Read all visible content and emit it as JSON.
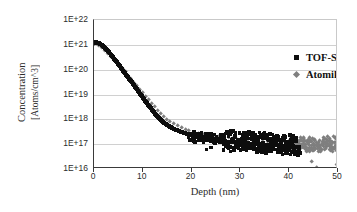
{
  "chart_data": {
    "type": "scatter",
    "title": "",
    "xlabel": "Depth (nm)",
    "ylabel_line1": "Concentration",
    "ylabel_line2": "[Atoms/cm^3]",
    "xlim": [
      0,
      50
    ],
    "ylim": [
      1e+16,
      1e+22
    ],
    "yscale": "log",
    "xticks": [
      0,
      10,
      20,
      30,
      40,
      50
    ],
    "xtick_labels": [
      "0",
      "10",
      "20",
      "30",
      "40",
      "50"
    ],
    "ytick_labels": [
      "1E+22",
      "1E+21",
      "1E+20",
      "1E+19",
      "1E+18",
      "1E+17",
      "1E+16"
    ],
    "ytick_values": [
      1e+22,
      1e+21,
      1e+20,
      1e+19,
      1e+18,
      1e+17,
      1e+16
    ],
    "grid": "horizontal",
    "legend_position": "inside-top-center",
    "colors": {
      "tof_sims": "#0d0d0d",
      "atomika": "#7f7f7f",
      "axis": "#3a3a3a",
      "grid": "#d0d0d0"
    },
    "series": [
      {
        "name": "TOF-SIMS IV",
        "marker": "square",
        "color": "#0d0d0d",
        "points": [
          [
            0.0,
            1.15e+21
          ],
          [
            0.3,
            1.3e+21
          ],
          [
            0.6,
            1.25e+21
          ],
          [
            0.9,
            1.2e+21
          ],
          [
            1.2,
            1.1e+21
          ],
          [
            1.5,
            1e+21
          ],
          [
            1.8,
            9e+20
          ],
          [
            2.1,
            8e+20
          ],
          [
            2.4,
            7e+20
          ],
          [
            2.7,
            6e+20
          ],
          [
            3.0,
            5.2e+20
          ],
          [
            3.3,
            4.4e+20
          ],
          [
            3.6,
            3.7e+20
          ],
          [
            3.9,
            3.1e+20
          ],
          [
            4.2,
            2.6e+20
          ],
          [
            4.5,
            2.2e+20
          ],
          [
            4.8,
            1.85e+20
          ],
          [
            5.1,
            1.55e+20
          ],
          [
            5.4,
            1.3e+20
          ],
          [
            5.7,
            1.08e+20
          ],
          [
            6.0,
            9e+19
          ],
          [
            6.3,
            7.5e+19
          ],
          [
            6.6,
            6.2e+19
          ],
          [
            6.9,
            5.2e+19
          ],
          [
            7.2,
            4.3e+19
          ],
          [
            7.5,
            3.6e+19
          ],
          [
            7.8,
            3e+19
          ],
          [
            8.1,
            2.5e+19
          ],
          [
            8.4,
            2.05e+19
          ],
          [
            8.7,
            1.7e+19
          ],
          [
            9.0,
            1.42e+19
          ],
          [
            9.3,
            1.18e+19
          ],
          [
            9.6,
            9.8e+18
          ],
          [
            9.9,
            8.1e+18
          ],
          [
            10.2,
            6.7e+18
          ],
          [
            10.5,
            5.6e+18
          ],
          [
            10.8,
            4.6e+18
          ],
          [
            11.1,
            3.85e+18
          ],
          [
            11.4,
            3.2e+18
          ],
          [
            11.7,
            2.7e+18
          ],
          [
            12.0,
            2.25e+18
          ],
          [
            12.3,
            1.9e+18
          ],
          [
            12.6,
            1.62e+18
          ],
          [
            12.9,
            1.4e+18
          ],
          [
            13.2,
            1.2e+18
          ],
          [
            13.5,
            1.05e+18
          ],
          [
            13.8,
            9.2e+17
          ],
          [
            14.1,
            8.1e+17
          ],
          [
            14.4,
            7.2e+17
          ],
          [
            14.7,
            6.4e+17
          ],
          [
            15.0,
            5.8e+17
          ],
          [
            15.4,
            5.2e+17
          ],
          [
            15.8,
            4.7e+17
          ],
          [
            16.2,
            4.3e+17
          ],
          [
            16.6,
            3.95e+17
          ],
          [
            17.0,
            3.65e+17
          ],
          [
            17.4,
            3.4e+17
          ],
          [
            17.8,
            3.15e+17
          ],
          [
            18.2,
            2.95e+17
          ],
          [
            18.6,
            2.75e+17
          ],
          [
            19.0,
            2.6e+17
          ],
          [
            19.4,
            2.45e+17
          ],
          [
            19.8,
            2.3e+17
          ],
          [
            20.2,
            2.2e+17
          ],
          [
            20.6,
            2.1e+17
          ],
          [
            21.0,
            2e+17
          ],
          [
            21.5,
            1.9e+17
          ],
          [
            22.0,
            1.82e+17
          ],
          [
            22.5,
            1.75e+17
          ],
          [
            23.0,
            1.68e+17
          ],
          [
            23.5,
            1.6e+17
          ],
          [
            24.0,
            1.55e+17
          ],
          [
            24.5,
            1.5e+17
          ],
          [
            25.0,
            1.45e+17
          ],
          [
            25.5,
            1.4e+17
          ],
          [
            26.0,
            1.36e+17
          ],
          [
            26.5,
            1.32e+17
          ],
          [
            27.0,
            1.3e+17
          ],
          [
            27.5,
            1.26e+17
          ],
          [
            28.0,
            1.24e+17
          ],
          [
            28.5,
            1.2e+17
          ],
          [
            29.0,
            1.18e+17
          ],
          [
            29.5,
            1.15e+17
          ],
          [
            30.0,
            1.13e+17
          ],
          [
            30.5,
            1.1e+17
          ],
          [
            31.0,
            1.09e+17
          ],
          [
            31.5,
            1.07e+17
          ],
          [
            32.0,
            1.05e+17
          ],
          [
            32.5,
            1.04e+17
          ],
          [
            33.0,
            1.02e+17
          ],
          [
            33.5,
            1e+17
          ],
          [
            34.0,
            9.9e+16
          ],
          [
            34.5,
            9.8e+16
          ],
          [
            35.0,
            9.6e+16
          ],
          [
            35.5,
            9.5e+16
          ],
          [
            36.0,
            9.4e+16
          ],
          [
            36.5,
            9.2e+16
          ],
          [
            37.0,
            9.1e+16
          ],
          [
            37.5,
            9e+16
          ],
          [
            38.0,
            8.9e+16
          ],
          [
            38.5,
            8.8e+16
          ],
          [
            39.0,
            8.7e+16
          ],
          [
            39.5,
            8.6e+16
          ],
          [
            40.0,
            8.5e+16
          ],
          [
            40.5,
            8.3e+16
          ],
          [
            41.0,
            8.2e+16
          ],
          [
            41.5,
            8e+16
          ],
          [
            42.0,
            7.9e+16
          ]
        ],
        "scatter_low": [
          [
            23.0,
            6.2e+16
          ],
          [
            24.0,
            7.5e+16
          ],
          [
            26.5,
            5.8e+16
          ],
          [
            28.0,
            5e+16
          ],
          [
            28.8,
            6.6e+16
          ],
          [
            29.6,
            7e+16
          ],
          [
            30.4,
            6.4e+16
          ],
          [
            31.2,
            5.6e+16
          ],
          [
            32.0,
            6.9e+16
          ],
          [
            32.8,
            6.1e+16
          ],
          [
            33.6,
            5.4e+16
          ],
          [
            34.4,
            6.8e+16
          ],
          [
            35.2,
            6e+16
          ],
          [
            36.0,
            5.2e+16
          ],
          [
            36.8,
            6.5e+16
          ],
          [
            37.6,
            5.9e+16
          ],
          [
            38.4,
            4.7e+16
          ],
          [
            39.2,
            6.3e+16
          ],
          [
            40.0,
            5.5e+16
          ],
          [
            40.8,
            4.9e+16
          ],
          [
            41.6,
            5.1e+16
          ],
          [
            42.2,
            4.4e+16
          ]
        ],
        "scatter_high": [
          [
            20.5,
            3.1e+17
          ],
          [
            22.0,
            2.9e+17
          ],
          [
            24.0,
            2.6e+17
          ],
          [
            26.0,
            2.4e+17
          ],
          [
            27.5,
            2.2e+17
          ],
          [
            29.0,
            2.1e+17
          ],
          [
            30.5,
            2.05e+17
          ],
          [
            31.5,
            1.95e+17
          ],
          [
            33.0,
            1.8e+17
          ],
          [
            34.5,
            1.7e+17
          ],
          [
            36.0,
            1.6e+17
          ],
          [
            37.5,
            1.55e+17
          ],
          [
            39.0,
            1.5e+17
          ],
          [
            40.5,
            1.45e+17
          ],
          [
            41.5,
            1.4e+17
          ]
        ]
      },
      {
        "name": "Atomika",
        "marker": "diamond",
        "color": "#7f7f7f",
        "points": [
          [
            0.0,
            1.05e+21
          ],
          [
            0.5,
            1.1e+21
          ],
          [
            1.0,
            9.5e+20
          ],
          [
            1.6,
            7.5e+20
          ],
          [
            2.2,
            5.8e+20
          ],
          [
            2.8,
            4.5e+20
          ],
          [
            3.4,
            3.4e+20
          ],
          [
            4.0,
            2.6e+20
          ],
          [
            4.6,
            2e+20
          ],
          [
            5.2,
            1.5e+20
          ],
          [
            5.8,
            1.1e+20
          ],
          [
            6.4,
            8.2e+19
          ],
          [
            7.0,
            5.9e+19
          ],
          [
            7.6,
            4.3e+19
          ],
          [
            8.2,
            3.1e+19
          ],
          [
            8.8,
            2.2e+19
          ],
          [
            9.4,
            1.6e+19
          ],
          [
            10.0,
            1.15e+19
          ],
          [
            10.6,
            8.2e+18
          ],
          [
            11.2,
            5.9e+18
          ],
          [
            11.8,
            4.2e+18
          ],
          [
            12.4,
            3.1e+18
          ],
          [
            13.0,
            2.3e+18
          ],
          [
            13.6,
            1.7e+18
          ],
          [
            14.2,
            1.3e+18
          ],
          [
            14.8,
            1e+18
          ],
          [
            15.5,
            8e+17
          ],
          [
            16.3,
            6.4e+17
          ],
          [
            17.1,
            5.3e+17
          ],
          [
            17.9,
            4.5e+17
          ],
          [
            18.7,
            3.9e+17
          ],
          [
            19.5,
            3.4e+17
          ],
          [
            20.5,
            3e+17
          ],
          [
            21.5,
            2.7e+17
          ],
          [
            22.5,
            2.45e+17
          ],
          [
            23.5,
            2.25e+17
          ],
          [
            24.5,
            2.1e+17
          ],
          [
            25.5,
            1.95e+17
          ],
          [
            26.5,
            1.85e+17
          ],
          [
            27.5,
            1.75e+17
          ],
          [
            28.5,
            1.65e+17
          ],
          [
            29.5,
            1.58e+17
          ],
          [
            30.5,
            1.5e+17
          ],
          [
            31.5,
            1.45e+17
          ],
          [
            32.5,
            1.4e+17
          ],
          [
            33.5,
            1.35e+17
          ],
          [
            34.5,
            1.3e+17
          ],
          [
            35.5,
            1.26e+17
          ],
          [
            36.5,
            1.22e+17
          ],
          [
            37.5,
            1.18e+17
          ],
          [
            38.5,
            1.15e+17
          ],
          [
            39.5,
            1.12e+17
          ],
          [
            40.5,
            1.1e+17
          ],
          [
            41.3,
            1.05e+17
          ],
          [
            42.0,
            1e+17
          ],
          [
            42.7,
            9.8e+16
          ],
          [
            43.3,
            9.5e+16
          ],
          [
            44.0,
            9.2e+16
          ],
          [
            44.6,
            8.9e+16
          ],
          [
            45.2,
            8.7e+16
          ],
          [
            45.8,
            8.5e+16
          ],
          [
            46.4,
            8.3e+16
          ],
          [
            47.0,
            8.1e+16
          ],
          [
            47.6,
            7.9e+16
          ],
          [
            48.2,
            7.7e+16
          ],
          [
            48.8,
            7.5e+16
          ],
          [
            49.4,
            7.3e+16
          ],
          [
            50.0,
            7.1e+16
          ]
        ],
        "scatter_band": [
          [
            40.8,
            1.5e+17
          ],
          [
            41.5,
            1.35e+17
          ],
          [
            42.3,
            1.45e+17
          ],
          [
            43.0,
            1.3e+17
          ],
          [
            43.8,
            1.4e+17
          ],
          [
            44.5,
            1.25e+17
          ],
          [
            45.3,
            1.35e+17
          ],
          [
            46.0,
            1.2e+17
          ],
          [
            46.8,
            1.3e+17
          ],
          [
            47.5,
            1.18e+17
          ],
          [
            48.3,
            1.28e+17
          ],
          [
            49.0,
            1.15e+17
          ],
          [
            49.7,
            1.22e+17
          ],
          [
            41.0,
            7e+16
          ],
          [
            41.8,
            6.4e+16
          ],
          [
            42.6,
            7.2e+16
          ],
          [
            43.4,
            6.2e+16
          ],
          [
            44.2,
            6.9e+16
          ],
          [
            45.0,
            6e+16
          ],
          [
            45.8,
            6.7e+16
          ],
          [
            46.6,
            5.9e+16
          ],
          [
            47.4,
            6.6e+16
          ],
          [
            48.2,
            5.8e+16
          ],
          [
            49.0,
            6.4e+16
          ],
          [
            49.8,
            5.6e+16
          ],
          [
            40.2,
            1.25e+17
          ],
          [
            44.0,
            1.55e+17
          ],
          [
            47.0,
            1.45e+17
          ],
          [
            49.5,
            9e+16
          ],
          [
            48.5,
            9.5e+16
          ]
        ],
        "outliers_low": [
          [
            44.6,
            1.9e+16
          ],
          [
            45.6,
            1.15e+16
          ],
          [
            49.8,
            1.5e+16
          ],
          [
            50.0,
            1.35e+16
          ]
        ]
      }
    ]
  },
  "legend": {
    "entries": [
      {
        "label": "TOF-SIMS IV",
        "marker": "square"
      },
      {
        "label": "Atomika",
        "marker": "diamond"
      }
    ]
  },
  "axes": {
    "y_title_line1": "Concentration",
    "y_title_line2": "[Atoms/cm^3]",
    "x_title": "Depth (nm)"
  }
}
